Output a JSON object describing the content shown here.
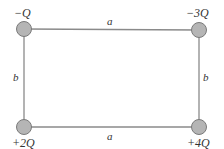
{
  "diagram": {
    "type": "rectangle-charges",
    "charges": {
      "top_left": "−Q",
      "top_right": "−3Q",
      "bottom_left": "+2Q",
      "bottom_right": "+4Q"
    },
    "sides": {
      "top": "a",
      "bottom": "a",
      "left": "b",
      "right": "b"
    },
    "colors": {
      "line": "#8a8a8a",
      "charge_fill": "#b5b5b5",
      "charge_stroke": "#7a7a7a",
      "text": "#333333"
    }
  }
}
